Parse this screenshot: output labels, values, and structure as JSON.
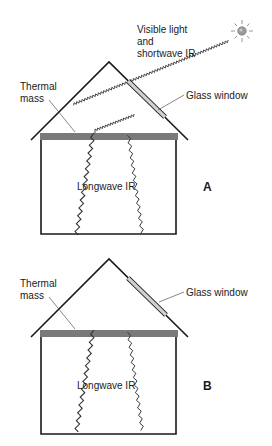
{
  "diagram": {
    "type": "passive solar heating schematic",
    "colors": {
      "line": "#1a1a1a",
      "thermal_mass": "#7a7a7a",
      "glass": "#d0d0d0",
      "sun": "#9a9a9a",
      "sun_rays": "#8a8a8a"
    },
    "panels": [
      {
        "id": "A",
        "panel_label": "A",
        "labels": {
          "sunlight": [
            "Visible light",
            "and",
            "shortwave IR"
          ],
          "thermal_mass": [
            "Thermal",
            "mass"
          ],
          "glass_window": "Glass window",
          "longwave_ir": "Longwave IR"
        },
        "shows_sun": true,
        "shows_incoming_light": true
      },
      {
        "id": "B",
        "panel_label": "B",
        "labels": {
          "thermal_mass": [
            "Thermal",
            "mass"
          ],
          "glass_window": "Glass window",
          "longwave_ir": "Longwave IR"
        },
        "shows_sun": false,
        "shows_incoming_light": false
      }
    ]
  }
}
